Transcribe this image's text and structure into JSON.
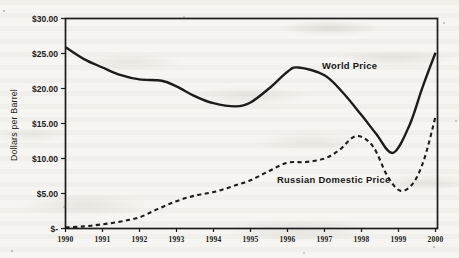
{
  "colors": {
    "ink": "#1c1c1c",
    "paper": "#f6f5f1"
  },
  "chart_data": {
    "type": "line",
    "title": "",
    "xlabel": "",
    "ylabel": "Dollars per Barrel",
    "xlim": [
      1990,
      2000
    ],
    "ylim": [
      0,
      30
    ],
    "grid": false,
    "legend_position": "inline-annotations",
    "x_ticks": [
      "1990",
      "1991",
      "1992",
      "1993",
      "1994",
      "1995",
      "1996",
      "1997",
      "1998",
      "1999",
      "2000"
    ],
    "y_ticks": [
      "$30.00",
      "$25.00",
      "$20.00",
      "$15.00",
      "$10.00",
      "$5.00",
      "$-"
    ],
    "y_tick_values": [
      30,
      25,
      20,
      15,
      10,
      5,
      0
    ],
    "series": [
      {
        "name": "World Price",
        "line_style": "solid",
        "color": "#1c1c1c",
        "x": [
          1990,
          1990.5,
          1991,
          1991.5,
          1992,
          1992.6,
          1993,
          1993.5,
          1994,
          1994.6,
          1995,
          1995.5,
          1996,
          1996.3,
          1997,
          1997.5,
          1998,
          1998.4,
          1998.85,
          1999.3,
          1999.65,
          2000
        ],
        "values": [
          25.9,
          24.2,
          23.0,
          21.9,
          21.3,
          21.1,
          20.3,
          18.9,
          17.9,
          17.45,
          18.0,
          20.0,
          22.4,
          23.0,
          21.9,
          19.4,
          16.2,
          13.5,
          10.8,
          14.8,
          20.2,
          25.1
        ]
      },
      {
        "name": "Russian Domestic Price",
        "line_style": "dashed",
        "color": "#1c1c1c",
        "x": [
          1990,
          1990.5,
          1991,
          1991.5,
          1992,
          1992.5,
          1993,
          1993.5,
          1994,
          1994.5,
          1995,
          1995.5,
          1996,
          1996.5,
          1997,
          1997.4,
          1997.85,
          1998.3,
          1998.7,
          1999.05,
          1999.4,
          1999.7,
          2000
        ],
        "values": [
          0.15,
          0.3,
          0.6,
          1.0,
          1.6,
          2.8,
          3.9,
          4.7,
          5.2,
          6.0,
          6.9,
          8.2,
          9.4,
          9.5,
          10.0,
          11.2,
          13.2,
          11.8,
          7.5,
          5.4,
          6.5,
          10.0,
          16.0
        ]
      }
    ]
  }
}
